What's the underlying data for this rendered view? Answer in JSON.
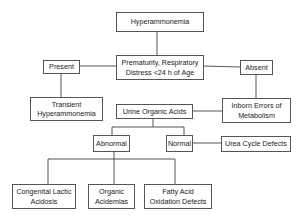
{
  "diagram": {
    "type": "flowchart",
    "nodes": {
      "root": "Hyperammonemia",
      "question": "Prematurity, Respiratory\nDistress <24 h of Age",
      "present": "Present",
      "absent": "Absent",
      "transient": "Transient\nHyperammonemia",
      "inborn": "Inborn Errors of\nMetabolism",
      "urine": "Urine Organic Acids",
      "abnormal": "Abnormal",
      "normal": "Normal",
      "urea": "Urea Cycle Defects",
      "lactic": "Congenital Lactic\nAcidosis",
      "organic": "Organic\nAcidemias",
      "fatty": "Fatty Acid\nOxidation Defects"
    },
    "edges": [
      [
        "root",
        "question"
      ],
      [
        "question",
        "present"
      ],
      [
        "question",
        "absent"
      ],
      [
        "present",
        "transient"
      ],
      [
        "absent",
        "inborn"
      ],
      [
        "inborn",
        "urine"
      ],
      [
        "urine",
        "abnormal"
      ],
      [
        "urine",
        "normal"
      ],
      [
        "normal",
        "urea"
      ],
      [
        "abnormal",
        "lactic"
      ],
      [
        "abnormal",
        "organic"
      ],
      [
        "abnormal",
        "fatty"
      ]
    ],
    "colors": {
      "line": "#555555",
      "text": "#222222",
      "background": "#ffffff"
    }
  }
}
